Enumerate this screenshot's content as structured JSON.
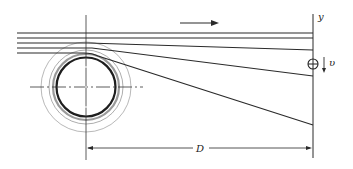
{
  "diagram": {
    "type": "beam deflection over cylinder / belt wrap schematic",
    "labels": {
      "y_axis": "y",
      "velocity": "υ",
      "distance": "D"
    },
    "symbols": {
      "target_marker": "circled-plus",
      "flow_direction": "right-arrow",
      "velocity_direction": "down-arrow"
    },
    "strands": [
      {
        "name": "strand-1",
        "start_y": 33,
        "end_y": 33
      },
      {
        "name": "strand-2",
        "start_y": 38,
        "end_y": 38
      },
      {
        "name": "strand-3",
        "start_y": 43,
        "end_y": 50
      },
      {
        "name": "strand-4",
        "start_y": 48,
        "end_y": 76
      },
      {
        "name": "strand-5",
        "start_y": 53,
        "end_y": 125
      }
    ],
    "colors": {
      "line": "#2a2a2a",
      "ring": "#8a8a8a",
      "background": "#ffffff"
    }
  }
}
